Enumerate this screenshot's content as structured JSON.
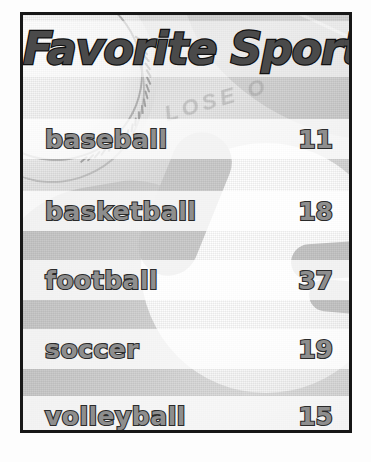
{
  "poster": {
    "title": "Favorite Sport",
    "frame_color": "#171717",
    "background_description": "grayscale photocopy of sports balls (baseball, football, volleyball)",
    "text_fill_color": "#8e8e8e",
    "text_outline_color": "#2a2a2a",
    "title_fill_color": "#4a4a4a",
    "band_color": "rgba(255,255,255,0.78)",
    "watermark_text": "LOSE O"
  },
  "chart_data": {
    "type": "table",
    "title": "Favorite Sport",
    "xlabel": "",
    "ylabel": "",
    "categories": [
      "baseball",
      "basketball",
      "football",
      "soccer",
      "volleyball"
    ],
    "values": [
      11,
      18,
      37,
      19,
      15
    ],
    "rows": [
      {
        "label": "baseball",
        "value": "11"
      },
      {
        "label": "basketball",
        "value": "18"
      },
      {
        "label": "football",
        "value": "37"
      },
      {
        "label": "soccer",
        "value": "19"
      },
      {
        "label": "volleyball",
        "value": "15"
      }
    ],
    "grid": false,
    "legend": "none"
  }
}
